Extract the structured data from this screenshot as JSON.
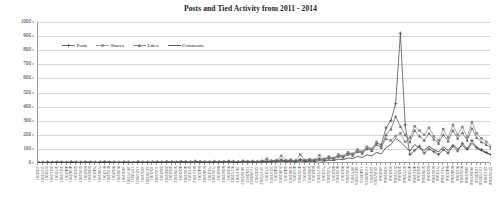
{
  "chart": {
    "title": "Posts and Tied Activity from 2011 - 2014"
  },
  "legend": {
    "position": "top-left-inside",
    "items": [
      {
        "label": "Posts",
        "marker": "cross-marker",
        "color": "#4a4a4a"
      },
      {
        "label": "Shares",
        "marker": "square-marker",
        "color": "#8c8c8c"
      },
      {
        "label": "Likes",
        "marker": "triangle-marker",
        "color": "#6b6b6b"
      },
      {
        "label": "Comments",
        "marker": "line-marker",
        "color": "#2e2e2e"
      }
    ]
  },
  "axes": {
    "y": {
      "label": "",
      "min": 0,
      "max": 1000,
      "step": 100,
      "ticks": [
        "0",
        "100",
        "200",
        "300",
        "400",
        "500",
        "600",
        "700",
        "800",
        "900",
        "1000"
      ]
    },
    "x": {
      "label": "",
      "rotation": 90
    }
  },
  "chart_data": {
    "type": "line",
    "title": "Posts and Tied Activity from 2011 - 2014",
    "xlabel": "",
    "ylabel": "",
    "ylim": [
      0,
      1000
    ],
    "grid": true,
    "legend_position": "top-left-inside",
    "categories": [
      "1/3/2011",
      "1/17/2011",
      "2/7/2011",
      "2/21/2011",
      "3/7/2011",
      "3/21/2011",
      "4/4/2011",
      "4/18/2011",
      "5/2/2011",
      "5/16/2011",
      "6/6/2011",
      "6/20/2011",
      "7/4/2011",
      "7/18/2011",
      "8/1/2011",
      "8/15/2011",
      "9/5/2011",
      "9/19/2011",
      "10/3/2011",
      "10/17/2011",
      "11/7/2011",
      "11/21/2011",
      "12/5/2011",
      "12/19/2011",
      "1/2/2012",
      "1/16/2012",
      "2/6/2012",
      "2/20/2012",
      "3/5/2012",
      "3/19/2012",
      "4/2/2012",
      "4/16/2012",
      "5/7/2012",
      "5/21/2012",
      "6/4/2012",
      "6/18/2012",
      "7/2/2012",
      "7/16/2012",
      "8/6/2012",
      "8/20/2012",
      "9/3/2012",
      "9/17/2012",
      "10/1/2012",
      "10/15/2012",
      "11/5/2012",
      "11/19/2012",
      "12/3/2012",
      "12/17/2012",
      "1/7/2013",
      "1/21/2013",
      "2/4/2013",
      "2/18/2013",
      "3/4/2013",
      "3/18/2013",
      "4/1/2013",
      "4/15/2013",
      "5/6/2013",
      "5/20/2013",
      "6/3/2013",
      "6/17/2013",
      "7/1/2013",
      "7/15/2013",
      "8/5/2013",
      "8/19/2013",
      "9/2/2013",
      "9/16/2013",
      "10/7/2013",
      "10/21/2013",
      "11/4/2013",
      "11/18/2013",
      "12/2/2013",
      "12/16/2013",
      "1/6/2014",
      "1/20/2014",
      "2/3/2014",
      "2/17/2014",
      "3/3/2014",
      "3/17/2014",
      "4/7/2014",
      "4/21/2014",
      "5/5/2014",
      "5/19/2014",
      "6/2/2014",
      "6/16/2014",
      "7/7/2014",
      "7/21/2014",
      "8/4/2014",
      "8/18/2014",
      "9/1/2014",
      "9/15/2014",
      "10/6/2014",
      "10/20/2014",
      "11/3/2014",
      "11/17/2014",
      "12/1/2014",
      "12/15/2014"
    ],
    "series": [
      {
        "name": "Posts",
        "color": "#4a4a4a",
        "marker": "cross-marker",
        "values": [
          5,
          4,
          6,
          5,
          7,
          6,
          5,
          8,
          6,
          5,
          7,
          6,
          5,
          6,
          8,
          7,
          6,
          5,
          7,
          6,
          5,
          8,
          6,
          7,
          6,
          8,
          7,
          9,
          8,
          7,
          10,
          9,
          8,
          12,
          10,
          9,
          8,
          11,
          9,
          10,
          12,
          11,
          9,
          13,
          11,
          12,
          10,
          14,
          12,
          15,
          18,
          22,
          16,
          20,
          14,
          26,
          18,
          24,
          20,
          30,
          25,
          40,
          30,
          55,
          45,
          70,
          60,
          90,
          75,
          110,
          95,
          140,
          130,
          250,
          300,
          420,
          920,
          270,
          60,
          90,
          120,
          70,
          100,
          80,
          60,
          95,
          70,
          120,
          85,
          140,
          100,
          160,
          110,
          95,
          75,
          60
        ]
      },
      {
        "name": "Shares",
        "color": "#8c8c8c",
        "marker": "square-marker",
        "values": [
          3,
          2,
          4,
          3,
          5,
          4,
          3,
          6,
          4,
          3,
          5,
          4,
          3,
          4,
          6,
          5,
          4,
          3,
          5,
          4,
          3,
          6,
          4,
          5,
          4,
          6,
          5,
          7,
          6,
          5,
          8,
          7,
          6,
          10,
          8,
          7,
          6,
          9,
          7,
          8,
          10,
          9,
          7,
          11,
          9,
          10,
          8,
          12,
          30,
          14,
          16,
          50,
          18,
          22,
          16,
          60,
          20,
          26,
          22,
          55,
          28,
          45,
          35,
          60,
          50,
          75,
          65,
          95,
          80,
          115,
          100,
          150,
          120,
          170,
          160,
          190,
          210,
          150,
          180,
          260,
          230,
          200,
          250,
          190,
          160,
          240,
          180,
          270,
          200,
          255,
          185,
          290,
          210,
          175,
          150,
          120
        ]
      },
      {
        "name": "Likes",
        "color": "#6b6b6b",
        "marker": "triangle-marker",
        "values": [
          4,
          3,
          5,
          4,
          6,
          5,
          4,
          7,
          5,
          4,
          6,
          5,
          4,
          5,
          7,
          6,
          5,
          4,
          6,
          5,
          4,
          7,
          5,
          6,
          5,
          7,
          6,
          8,
          7,
          6,
          9,
          8,
          7,
          11,
          9,
          8,
          7,
          10,
          8,
          9,
          11,
          10,
          8,
          12,
          10,
          11,
          9,
          13,
          11,
          13,
          16,
          20,
          15,
          18,
          13,
          23,
          17,
          21,
          18,
          27,
          22,
          35,
          28,
          48,
          40,
          62,
          55,
          80,
          68,
          100,
          88,
          130,
          110,
          200,
          240,
          330,
          260,
          200,
          150,
          230,
          190,
          160,
          210,
          170,
          140,
          200,
          155,
          230,
          175,
          215,
          160,
          245,
          180,
          150,
          130,
          105
        ]
      },
      {
        "name": "Comments",
        "color": "#2e2e2e",
        "marker": "line-marker",
        "values": [
          2,
          2,
          3,
          2,
          3,
          3,
          2,
          4,
          3,
          2,
          3,
          3,
          2,
          3,
          4,
          3,
          3,
          2,
          3,
          3,
          2,
          4,
          3,
          3,
          3,
          4,
          3,
          5,
          4,
          3,
          5,
          4,
          4,
          6,
          5,
          4,
          4,
          6,
          5,
          5,
          6,
          6,
          4,
          7,
          6,
          6,
          5,
          8,
          7,
          8,
          10,
          12,
          9,
          11,
          8,
          14,
          10,
          13,
          11,
          16,
          13,
          20,
          17,
          28,
          23,
          36,
          32,
          46,
          40,
          58,
          50,
          75,
          65,
          110,
          130,
          175,
          150,
          115,
          85,
          130,
          105,
          90,
          120,
          95,
          78,
          115,
          88,
          130,
          100,
          125,
          92,
          140,
          105,
          86,
          72,
          58
        ]
      }
    ]
  }
}
